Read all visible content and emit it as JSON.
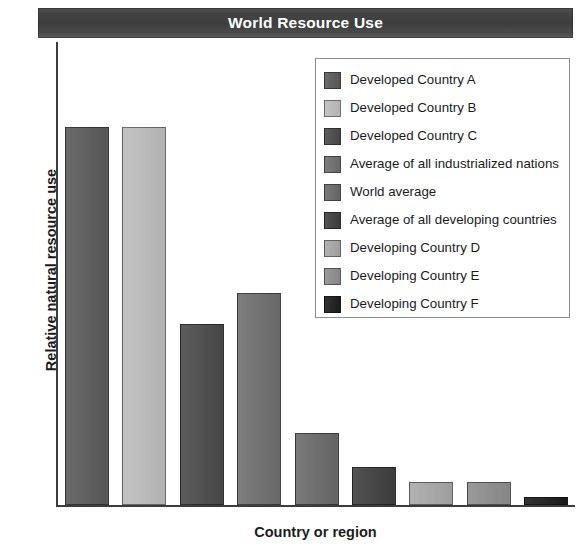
{
  "chart_data": {
    "type": "bar",
    "title": "World Resource Use",
    "xlabel": "Country or region",
    "ylabel": "Relative natural resource use",
    "grid": false,
    "legend_position": "top-right",
    "ylim": [
      0,
      100
    ],
    "axis_tick_labels": [],
    "categories": [
      "Developed Country A",
      "Developed Country B",
      "Developed Country C",
      "Average of all industrialized nations",
      "World average",
      "Average of all developing countries",
      "Developing Country D",
      "Developing Country E",
      "Developing Country F"
    ],
    "values": [
      100,
      100,
      48,
      56,
      19,
      10,
      6,
      6,
      2
    ],
    "colors": [
      "#5a5a5a",
      "#bdbdbd",
      "#4a4a4a",
      "#6f6f6f",
      "#6a6a6a",
      "#3f3f3f",
      "#a8a8a8",
      "#8e8e8e",
      "#1c1c1c"
    ]
  },
  "legend": {
    "entries": [
      {
        "label": "Developed Country A",
        "color": "#5a5a5a"
      },
      {
        "label": "Developed Country B",
        "color": "#bdbdbd"
      },
      {
        "label": "Developed Country C",
        "color": "#4a4a4a"
      },
      {
        "label": "Average of all industrialized nations",
        "color": "#6f6f6f"
      },
      {
        "label": "World average",
        "color": "#6a6a6a"
      },
      {
        "label": "Average of all developing countries",
        "color": "#3f3f3f"
      },
      {
        "label": "Developing Country D",
        "color": "#a8a8a8"
      },
      {
        "label": "Developing Country E",
        "color": "#8e8e8e"
      },
      {
        "label": "Developing Country F",
        "color": "#1c1c1c"
      }
    ]
  },
  "style": {
    "title_band_color": "#454545",
    "title_text_color": "#ffffff",
    "axis_color": "#3c3c3c",
    "legend_border_color": "#8d8d8d",
    "background": "#ffffff"
  }
}
